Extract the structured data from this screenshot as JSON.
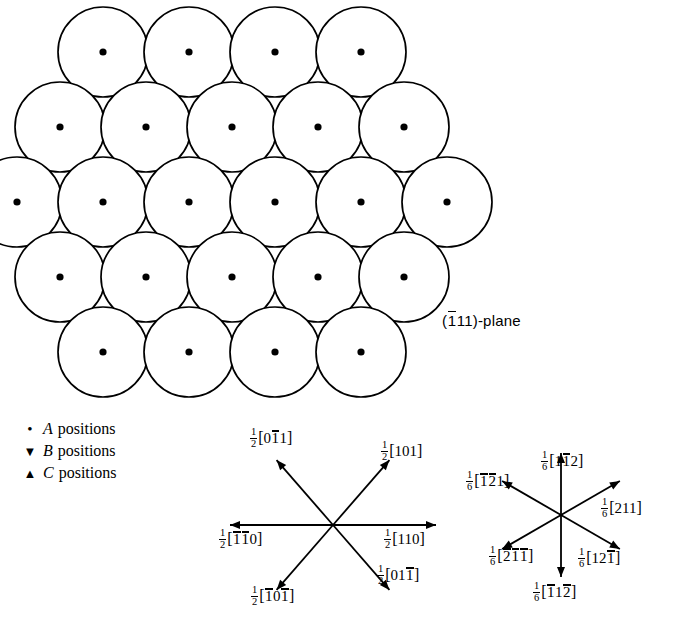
{
  "figure": {
    "type": "close-packed-plane-diagram"
  },
  "plane_label": {
    "prefix": "(",
    "index_1": "1",
    "index_1_bar": true,
    "index_2": "1",
    "index_3": "1",
    "suffix": ")-plane",
    "full_text": "(̀1 1 1)-plane"
  },
  "legend": {
    "title": "",
    "items": [
      {
        "marker": "dot",
        "glyph": "•",
        "letter": "A",
        "label": "positions",
        "name": "a-positions"
      },
      {
        "marker": "triangle-down",
        "glyph": "▼",
        "letter": "B",
        "label": "positions",
        "name": "b-positions"
      },
      {
        "marker": "triangle-up",
        "glyph": "▲",
        "letter": "C",
        "label": "positions",
        "name": "c-positions"
      }
    ]
  },
  "lattice": {
    "sphere_radius": 45,
    "row_counts": [
      4,
      5,
      6,
      5,
      4
    ],
    "row_spacing": 75,
    "column_spacing": 86,
    "center_x": 232,
    "center_y": 202,
    "marker_dot_radius": 3.6,
    "triangle_size": 11,
    "stroke": "#000000",
    "fill": "#ffffff"
  },
  "vector_diagram_left": {
    "name": "perfect-dislocation-burgers-vectors",
    "center": {
      "x": 333,
      "y": 525
    },
    "arrow_length_diag": 86,
    "arrow_length_horiz": 103,
    "vectors": [
      {
        "name": "vector-half-0bar11",
        "angle_deg": 131,
        "fraction": {
          "num": "1",
          "den": "2"
        },
        "digits": [
          {
            "d": "0",
            "bar": false
          },
          {
            "d": "1",
            "bar": true
          },
          {
            "d": "1",
            "bar": false
          }
        ],
        "label_text": "½[0̀1 1]",
        "label_pos": {
          "x": 250,
          "y": 427
        }
      },
      {
        "name": "vector-half-101",
        "angle_deg": 49,
        "fraction": {
          "num": "1",
          "den": "2"
        },
        "digits": [
          {
            "d": "1",
            "bar": false
          },
          {
            "d": "0",
            "bar": false
          },
          {
            "d": "1",
            "bar": false
          }
        ],
        "label_text": "½[101]",
        "label_pos": {
          "x": 381,
          "y": 440
        }
      },
      {
        "name": "vector-half-110",
        "angle_deg": 0,
        "fraction": {
          "num": "1",
          "den": "2"
        },
        "digits": [
          {
            "d": "1",
            "bar": false
          },
          {
            "d": "1",
            "bar": false
          },
          {
            "d": "0",
            "bar": false
          }
        ],
        "label_text": "½[110]",
        "label_pos": {
          "x": 384,
          "y": 528
        }
      },
      {
        "name": "vector-half-01bar1",
        "angle_deg": -49,
        "fraction": {
          "num": "1",
          "den": "2"
        },
        "digits": [
          {
            "d": "0",
            "bar": false
          },
          {
            "d": "1",
            "bar": false
          },
          {
            "d": "1",
            "bar": true
          }
        ],
        "label_text": "½[01̀1]",
        "label_pos": {
          "x": 377,
          "y": 564
        }
      },
      {
        "name": "vector-half-1bar0-1bar",
        "angle_deg": -131,
        "fraction": {
          "num": "1",
          "den": "2"
        },
        "digits": [
          {
            "d": "1",
            "bar": true
          },
          {
            "d": "0",
            "bar": false
          },
          {
            "d": "1",
            "bar": true
          }
        ],
        "label_text": "½[̀1 0 ̀1]",
        "label_pos": {
          "x": 251,
          "y": 585
        }
      },
      {
        "name": "vector-half-1bar1bar0",
        "angle_deg": 180,
        "fraction": {
          "num": "1",
          "den": "2"
        },
        "digits": [
          {
            "d": "1",
            "bar": true
          },
          {
            "d": "1",
            "bar": true
          },
          {
            "d": "0",
            "bar": false
          }
        ],
        "label_text": "½[̀1 ̀1 0]",
        "label_pos": {
          "x": 219,
          "y": 528
        }
      }
    ]
  },
  "vector_diagram_right": {
    "name": "partial-dislocation-burgers-vectors",
    "center": {
      "x": 561,
      "y": 515
    },
    "arrow_length_diag": 68,
    "arrow_length_vert": 62,
    "vectors": [
      {
        "name": "vector-sixth-11bar2",
        "angle_deg": 90,
        "fraction": {
          "num": "1",
          "den": "6"
        },
        "digits": [
          {
            "d": "1",
            "bar": false
          },
          {
            "d": "1",
            "bar": true
          },
          {
            "d": "2",
            "bar": false
          }
        ],
        "label_text": "⅚[1̀1 2]",
        "label_pos": {
          "x": 541,
          "y": 450
        }
      },
      {
        "name": "vector-sixth-1bar2bar1",
        "angle_deg": 150,
        "fraction": {
          "num": "1",
          "den": "6"
        },
        "digits": [
          {
            "d": "1",
            "bar": true
          },
          {
            "d": "2",
            "bar": true
          },
          {
            "d": "1",
            "bar": false
          }
        ],
        "label_text": "⅚[̀1 ̀2 1]",
        "label_pos": {
          "x": 466,
          "y": 470
        }
      },
      {
        "name": "vector-sixth-211",
        "angle_deg": 30,
        "fraction": {
          "num": "1",
          "den": "6"
        },
        "digits": [
          {
            "d": "2",
            "bar": false
          },
          {
            "d": "1",
            "bar": false
          },
          {
            "d": "1",
            "bar": false
          }
        ],
        "label_text": "⅚[211]",
        "label_pos": {
          "x": 601,
          "y": 497
        }
      },
      {
        "name": "vector-sixth-2bar1bar1bar",
        "angle_deg": -150,
        "fraction": {
          "num": "1",
          "den": "6"
        },
        "digits": [
          {
            "d": "2",
            "bar": true
          },
          {
            "d": "1",
            "bar": true
          },
          {
            "d": "1",
            "bar": true
          }
        ],
        "label_text": "⅚[̀2 ̀1 ̀1]",
        "label_pos": {
          "x": 489,
          "y": 545
        }
      },
      {
        "name": "vector-sixth-121bar",
        "angle_deg": -90,
        "fraction": {
          "num": "1",
          "den": "6"
        },
        "digits": [
          {
            "d": "1",
            "bar": false
          },
          {
            "d": "2",
            "bar": false
          },
          {
            "d": "1",
            "bar": true
          }
        ],
        "label_text": "⅚[12̀1]",
        "label_pos": {
          "x": 578,
          "y": 547
        }
      },
      {
        "name": "vector-sixth-1bar12bar",
        "angle_deg": -30,
        "fraction": {
          "num": "1",
          "den": "6"
        },
        "digits": [
          {
            "d": "1",
            "bar": true
          },
          {
            "d": "1",
            "bar": false
          },
          {
            "d": "2",
            "bar": true
          }
        ],
        "label_text": "⅚[̀1 1 ̀2]",
        "label_pos": {
          "x": 533,
          "y": 581
        }
      }
    ]
  },
  "plane_label_pos": {
    "x": 442,
    "y": 312
  }
}
